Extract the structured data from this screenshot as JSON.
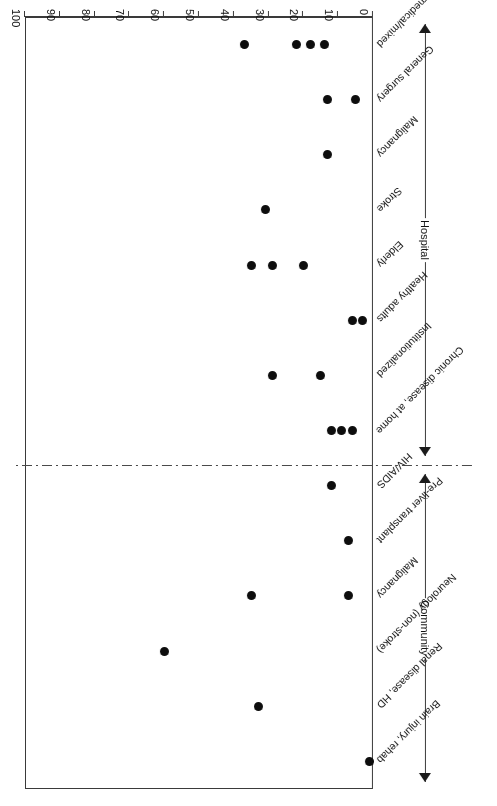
{
  "figure": {
    "orientation_note": "rendered upside down",
    "axis_title_main": "Proportion of patients with BMI < 20 kg m",
    "axis_title_sup": "−2",
    "axis_title_unit": " (%)"
  },
  "groups": [
    {
      "name": "hospital-group",
      "label": "Hospital"
    },
    {
      "name": "community-group",
      "label": "Community"
    }
  ],
  "chart_data": {
    "type": "scatter",
    "title": "",
    "subtitle": "",
    "xlabel": "Proportion of patients with BMI < 20 kg m−2 (%)",
    "ylabel": "",
    "xlim": [
      0,
      100
    ],
    "xticks": [
      0,
      10,
      20,
      30,
      40,
      50,
      60,
      70,
      80,
      90,
      100
    ],
    "xtick_labels": [
      "0",
      "10",
      "20",
      "30",
      "40",
      "50",
      "60",
      "70",
      "80",
      "90",
      "100"
    ],
    "grid": false,
    "legend": false,
    "orientation": "horizontal-dotplot",
    "annotations": [
      "Hospital",
      "Community"
    ],
    "divider": "dash-dot line between Hospital and Community groups",
    "categories": [
      {
        "label": "General medical/mixed",
        "group": "Hospital",
        "values": [
          37,
          22,
          18,
          14
        ]
      },
      {
        "label": "General surgery",
        "group": "Hospital",
        "values": [
          13,
          5
        ]
      },
      {
        "label": "Malignancy",
        "group": "Hospital",
        "values": [
          13
        ]
      },
      {
        "label": "Stroke",
        "group": "Hospital",
        "values": [
          31
        ]
      },
      {
        "label": "Elderly",
        "group": "Hospital",
        "values": [
          35,
          29,
          20
        ]
      },
      {
        "label": "Healthy adults",
        "group": "Community",
        "values": [
          6,
          3
        ]
      },
      {
        "label": "Institutionalized",
        "group": "Community",
        "values": [
          29,
          15
        ]
      },
      {
        "label": "Chronic disease, at home",
        "group": "Community",
        "values": [
          12,
          9,
          6
        ]
      },
      {
        "label": "HIV/AIDS",
        "group": "Community",
        "values": [
          12
        ]
      },
      {
        "label": "Pre-liver transplant",
        "group": "Community",
        "values": [
          7
        ]
      },
      {
        "label": "Malignancy",
        "group": "Community",
        "values": [
          35,
          7
        ]
      },
      {
        "label": "Neurology (non-stroke)",
        "group": "Community",
        "values": [
          60
        ]
      },
      {
        "label": "Renal disease, HD",
        "group": "Community",
        "values": [
          33
        ]
      },
      {
        "label": "Brain injury, rehab",
        "group": "Community",
        "values": [
          1
        ]
      }
    ]
  }
}
